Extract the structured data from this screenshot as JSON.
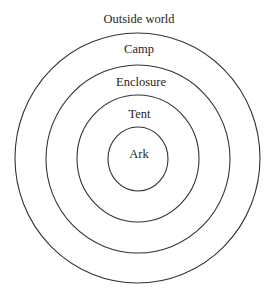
{
  "diagram": {
    "type": "concentric-circles",
    "center": {
      "x": 138,
      "y": 158.5
    },
    "line_color": "#333333",
    "text_color": "#1e1e1e",
    "background_color": "#ffffff",
    "rings": [
      {
        "id": "outside-world",
        "label": "Outside world",
        "rx": null,
        "ry": null,
        "label_y": 23
      },
      {
        "id": "camp",
        "label": "Camp",
        "rx": 122.5,
        "ry": 125,
        "label_y": 53
      },
      {
        "id": "enclosure",
        "label": "Enclosure",
        "rx": 92,
        "ry": 94,
        "label_y": 86
      },
      {
        "id": "tent",
        "label": "Tent",
        "rx": 61,
        "ry": 63.5,
        "label_y": 118
      },
      {
        "id": "ark",
        "label": "Ark",
        "rx": 30,
        "ry": 32,
        "label_y": 158
      }
    ]
  }
}
